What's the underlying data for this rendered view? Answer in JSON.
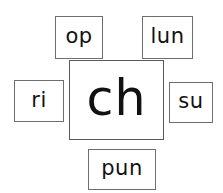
{
  "worksheet": {
    "type": "word-building-diagram",
    "root": {
      "text": "ch",
      "position": "center"
    },
    "affixes": [
      {
        "id": "op",
        "text": "op",
        "position": "top-left"
      },
      {
        "id": "lun",
        "text": "lun",
        "position": "top-right"
      },
      {
        "id": "ri",
        "text": "ri",
        "position": "left"
      },
      {
        "id": "su",
        "text": "su",
        "position": "right"
      },
      {
        "id": "pun",
        "text": "pun",
        "position": "bottom"
      }
    ],
    "colors": {
      "background": "#ffffff",
      "border": "#6e6e6e",
      "text": "#121212"
    }
  }
}
